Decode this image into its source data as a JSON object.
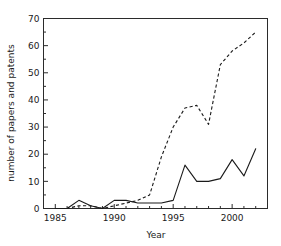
{
  "chart_data": {
    "type": "line",
    "title": "",
    "xlabel": "Year",
    "ylabel": "number of papers and patents",
    "xlim": [
      1984,
      2003
    ],
    "ylim": [
      0,
      70
    ],
    "grid": false,
    "legend_position": "none",
    "x_ticks": [
      1985,
      1990,
      1995,
      2000
    ],
    "x_tick_labels": [
      "1985",
      "1990",
      "1995",
      "2000"
    ],
    "x_minor_step": 1,
    "y_ticks": [
      0,
      10,
      20,
      30,
      40,
      50,
      60,
      70
    ],
    "y_tick_labels": [
      "0",
      "10",
      "20",
      "30",
      "40",
      "50",
      "60",
      "70"
    ],
    "y_minor_step": 5,
    "x": [
      1985,
      1986,
      1987,
      1988,
      1989,
      1990,
      1991,
      1992,
      1993,
      1994,
      1995,
      1996,
      1997,
      1998,
      1999,
      2000,
      2001,
      2002
    ],
    "series": [
      {
        "name": "papers",
        "style": "solid",
        "color": "#1a1a1a",
        "values": [
          0,
          0,
          3,
          1,
          0,
          3,
          3,
          2,
          2,
          2,
          3,
          16,
          10,
          10,
          11,
          18,
          12,
          22
        ]
      },
      {
        "name": "patents",
        "style": "dashed",
        "color": "#1a1a1a",
        "values": [
          0,
          0,
          1,
          1,
          0,
          1,
          2,
          3,
          5,
          19,
          30,
          37,
          38,
          31,
          53,
          58,
          61,
          65
        ]
      }
    ]
  },
  "axis": {
    "x_title": "Year",
    "y_title": "number of papers and patents"
  }
}
